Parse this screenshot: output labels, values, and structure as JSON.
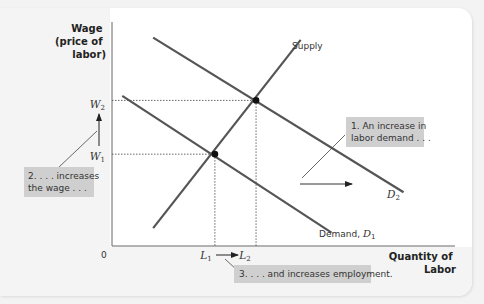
{
  "chart_data": {
    "type": "line",
    "title": "",
    "ylabel": "Wage (price of labor)",
    "ylabel_lines": [
      "Wage",
      "(price of",
      "labor)"
    ],
    "xlabel": "Quantity of Labor",
    "xlabel_lines": [
      "Quantity of",
      "Labor"
    ],
    "origin_label": "0",
    "grid": false,
    "series": [
      {
        "name": "Supply",
        "label": "Supply",
        "points": [
          [
            0.12,
            0.08
          ],
          [
            0.55,
            0.92
          ]
        ]
      },
      {
        "name": "Demand, D1",
        "label_main": "Demand, ",
        "label_var": "D",
        "label_sub": "1",
        "points": [
          [
            0.03,
            0.67
          ],
          [
            0.64,
            0.06
          ]
        ]
      },
      {
        "name": "D2",
        "label_var": "D",
        "label_sub": "2",
        "points": [
          [
            0.12,
            0.93
          ],
          [
            0.85,
            0.24
          ]
        ]
      }
    ],
    "equilibria": [
      {
        "name": "E1",
        "x_label": "L",
        "x_sub": "1",
        "y_label": "W",
        "y_sub": "1",
        "x": 0.3,
        "y": 0.41
      },
      {
        "name": "E2",
        "x_label": "L",
        "x_sub": "2",
        "y_label": "W",
        "y_sub": "2",
        "x": 0.42,
        "y": 0.65
      }
    ],
    "annotations": [
      {
        "id": "callout-1",
        "lines": [
          "1. An increase in",
          "labor demand . . ."
        ]
      },
      {
        "id": "callout-2",
        "lines": [
          "2. . . . increases",
          "the wage . . ."
        ]
      },
      {
        "id": "callout-3",
        "lines": [
          "3. . . . and increases employment."
        ]
      }
    ],
    "colors": {
      "curve": "#555555",
      "callout_bg": "#cfcfcf",
      "axis": "#666666",
      "point": "#111111"
    }
  }
}
